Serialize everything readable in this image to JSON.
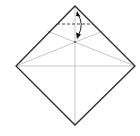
{
  "diagram": {
    "title": "",
    "colors": {
      "background": "#ffffff",
      "outline": "#2a2a2a",
      "crease": "#b8b8b8",
      "fold_line": "#333333",
      "arrow": "#111111",
      "target_dot": "#555555"
    },
    "elements": {
      "paper_outline": "square paper rotated 45 degrees",
      "crease_vertical": "vertical center crease",
      "crease_horizontal": "horizontal center crease",
      "crease_diagonal_left": "crease from left corner through intersection",
      "crease_diagonal_right": "crease from right corner through intersection",
      "valley_fold_line": "dashed valley fold line",
      "fold_arrow": "curved arrow from top corner to intersection",
      "target_point": "crease intersection point"
    }
  }
}
